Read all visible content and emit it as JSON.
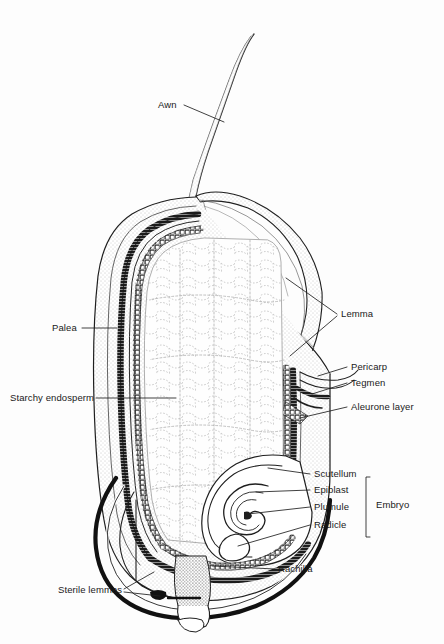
{
  "figure": {
    "background_color": "#fdfdfd",
    "ink_color": "#1a1a1a",
    "labels": [
      {
        "id": "awn",
        "text": "Awn",
        "x": 158,
        "y": 105,
        "align": "left"
      },
      {
        "id": "palea",
        "text": "Palea",
        "x": 52,
        "y": 331,
        "align": "left"
      },
      {
        "id": "starchy-endosperm",
        "text": "Starchy endosperm",
        "x": 10,
        "y": 401,
        "align": "left"
      },
      {
        "id": "sterile-lemmas",
        "text": "Sterile lemmas",
        "x": 58,
        "y": 592,
        "align": "left"
      },
      {
        "id": "lemma",
        "text": "Lemma",
        "x": 340,
        "y": 310,
        "align": "left"
      },
      {
        "id": "pericarp",
        "text": "Pericarp",
        "x": 350,
        "y": 369,
        "align": "left"
      },
      {
        "id": "tegmen",
        "text": "Tegmen",
        "x": 350,
        "y": 385,
        "align": "left"
      },
      {
        "id": "aleurone-layer",
        "text": "Aleurone layer",
        "x": 350,
        "y": 409,
        "align": "left"
      },
      {
        "id": "scutellum",
        "text": "Scutellum",
        "x": 313,
        "y": 476,
        "align": "left"
      },
      {
        "id": "epiblast",
        "text": "Epiblast",
        "x": 313,
        "y": 492,
        "align": "left"
      },
      {
        "id": "plumule",
        "text": "Plumule",
        "x": 313,
        "y": 509,
        "align": "left"
      },
      {
        "id": "radicle",
        "text": "Radicle",
        "x": 313,
        "y": 527,
        "align": "left"
      },
      {
        "id": "embryo",
        "text": "Embryo",
        "x": 376,
        "y": 500,
        "align": "left"
      },
      {
        "id": "rachilla",
        "text": "Rachilla",
        "x": 278,
        "y": 571,
        "align": "left"
      }
    ]
  }
}
